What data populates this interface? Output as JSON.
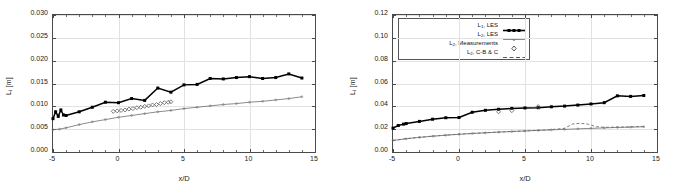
{
  "figure": {
    "panels": [
      "left",
      "right"
    ],
    "background": "#ffffff",
    "axis_color": "#4a4a4a",
    "grid_color": "#e2e2e2",
    "series_color": "#000000",
    "secondary_color": "#808080"
  },
  "left": {
    "ylabel_main": "L",
    "ylabel_sub": "i",
    "ylabel_unit": " [m]",
    "xlabel": "x/D",
    "yticks": [
      "0.000",
      "0.005",
      "0.010",
      "0.015",
      "0.020",
      "0.025",
      "0.030"
    ],
    "xticks": [
      "-5",
      "0",
      "5",
      "10",
      "15"
    ]
  },
  "right": {
    "ylabel_main": "L",
    "ylabel_sub": "i",
    "ylabel_unit": " [m]",
    "xlabel": "x/D",
    "yticks": [
      "0.00",
      "0.02",
      "0.04",
      "0.06",
      "0.08",
      "0.10",
      "0.12"
    ],
    "xticks": [
      "-5",
      "0",
      "5",
      "10",
      "15"
    ],
    "legend": [
      {
        "label_main": "L",
        "label_sub": "1",
        "label_rest": ", LES",
        "key": "solid-marker"
      },
      {
        "label_main": "L",
        "label_sub": "2",
        "label_rest": ", LES",
        "key": "thin-line"
      },
      {
        "label_main": "L",
        "label_sub": "2",
        "label_rest": ", Measurements",
        "key": "diamond"
      },
      {
        "label_main": "L",
        "label_sub": "2",
        "label_rest": ", C-B & C",
        "key": "dashed"
      }
    ]
  },
  "chart_data": [
    {
      "type": "line",
      "panel": "left",
      "title": "",
      "xlabel": "x/D",
      "ylabel": "L_i [m]",
      "xlim": [
        -5,
        15
      ],
      "ylim": [
        0.0,
        0.03
      ],
      "xticks": [
        -5,
        0,
        5,
        10,
        15
      ],
      "yticks": [
        0.0,
        0.005,
        0.01,
        0.015,
        0.02,
        0.025,
        0.03
      ],
      "grid": true,
      "legend_position": "none",
      "series": [
        {
          "name": "L1, LES",
          "style": "solid-with-square-markers",
          "color": "#000000",
          "x": [
            -5.0,
            -4.8,
            -4.6,
            -4.4,
            -4.2,
            -4.0,
            -3.0,
            -2.0,
            -1.0,
            0.0,
            1.0,
            2.0,
            3.0,
            4.0,
            5.0,
            6.0,
            7.0,
            8.0,
            9.0,
            10.0,
            11.0,
            12.0,
            13.0,
            14.0
          ],
          "y": [
            0.0073,
            0.0088,
            0.0078,
            0.0092,
            0.0081,
            0.008,
            0.0088,
            0.0098,
            0.0109,
            0.0108,
            0.0117,
            0.0113,
            0.014,
            0.0131,
            0.0147,
            0.0148,
            0.0161,
            0.016,
            0.0163,
            0.0165,
            0.0161,
            0.0163,
            0.0171,
            0.0162
          ]
        },
        {
          "name": "L2, LES",
          "style": "thin-line-with-small-markers",
          "color": "#6d6d6d",
          "x": [
            -5.0,
            -4.5,
            -4.0,
            -3.0,
            -2.0,
            -1.0,
            0.0,
            1.0,
            2.0,
            3.0,
            4.0,
            5.0,
            6.0,
            7.0,
            8.0,
            9.0,
            10.0,
            11.0,
            12.0,
            13.0,
            14.0
          ],
          "y": [
            0.0049,
            0.005,
            0.0053,
            0.006,
            0.0066,
            0.0071,
            0.0076,
            0.008,
            0.0084,
            0.0088,
            0.0091,
            0.0095,
            0.0098,
            0.0101,
            0.0104,
            0.0106,
            0.0109,
            0.0111,
            0.0114,
            0.0117,
            0.0121
          ]
        },
        {
          "name": "L2, Measurements",
          "style": "diamond-markers",
          "color": "#5a5a5a",
          "x": [
            -0.4,
            -0.1,
            0.2,
            0.5,
            0.8,
            1.1,
            1.4,
            1.7,
            2.0,
            2.3,
            2.6,
            2.9,
            3.2,
            3.5,
            3.8,
            4.0
          ],
          "y": [
            0.0089,
            0.009,
            0.0091,
            0.0092,
            0.0094,
            0.0095,
            0.0097,
            0.0098,
            0.01,
            0.0101,
            0.0103,
            0.0104,
            0.0106,
            0.0108,
            0.0109,
            0.011
          ]
        }
      ]
    },
    {
      "type": "line",
      "panel": "right",
      "title": "",
      "xlabel": "x/D",
      "ylabel": "L_i [m]",
      "xlim": [
        -5,
        15
      ],
      "ylim": [
        0.0,
        0.12
      ],
      "xticks": [
        -5,
        0,
        5,
        10,
        15
      ],
      "yticks": [
        0.0,
        0.02,
        0.04,
        0.06,
        0.08,
        0.1,
        0.12
      ],
      "grid": true,
      "legend_position": "upper-left",
      "series": [
        {
          "name": "L1, LES",
          "style": "solid-with-square-markers",
          "color": "#000000",
          "x": [
            -5.0,
            -4.6,
            -4.2,
            -4.0,
            -3.0,
            -2.0,
            -1.0,
            0.0,
            1.0,
            2.0,
            3.0,
            4.0,
            5.0,
            6.0,
            7.0,
            8.0,
            9.0,
            10.0,
            11.0,
            12.0,
            13.0,
            14.0
          ],
          "y": [
            0.0209,
            0.0232,
            0.0244,
            0.0249,
            0.0268,
            0.0287,
            0.03,
            0.0302,
            0.0348,
            0.0365,
            0.0374,
            0.0382,
            0.0386,
            0.0388,
            0.0396,
            0.0402,
            0.0411,
            0.0421,
            0.0432,
            0.0492,
            0.0487,
            0.0495
          ]
        },
        {
          "name": "L2, LES",
          "style": "thin-line-with-small-markers",
          "color": "#6d6d6d",
          "x": [
            -5.0,
            -4.0,
            -3.0,
            -2.0,
            -1.0,
            0.0,
            1.0,
            2.0,
            3.0,
            4.0,
            5.0,
            6.0,
            7.0,
            8.0,
            9.0,
            10.0,
            11.0,
            12.0,
            13.0,
            14.0
          ],
          "y": [
            0.0101,
            0.0116,
            0.0128,
            0.0138,
            0.0147,
            0.0155,
            0.0162,
            0.0168,
            0.0174,
            0.0179,
            0.0184,
            0.0189,
            0.0194,
            0.0198,
            0.0203,
            0.0207,
            0.0211,
            0.0215,
            0.0218,
            0.0221
          ]
        },
        {
          "name": "L2, Measurements",
          "style": "diamond-markers",
          "color": "#5a5a5a",
          "x": [
            3.0,
            4.0,
            6.0
          ],
          "y": [
            0.0352,
            0.0362,
            0.0398
          ]
        },
        {
          "name": "L2, C-B & C",
          "style": "dashed",
          "color": "#6d6d6d",
          "x": [
            -5.0,
            -4.0,
            -3.0,
            -2.0,
            -1.0,
            0.0,
            1.0,
            2.0,
            3.0,
            4.0,
            5.0,
            6.0,
            7.0,
            8.0,
            8.6,
            9.2,
            9.8,
            10.4,
            11.0,
            12.0,
            13.0,
            14.0
          ],
          "y": [
            0.0101,
            0.0117,
            0.0129,
            0.0139,
            0.0148,
            0.0156,
            0.0163,
            0.0169,
            0.0175,
            0.018,
            0.0185,
            0.019,
            0.0196,
            0.0208,
            0.0245,
            0.0252,
            0.0243,
            0.0222,
            0.0216,
            0.0218,
            0.022,
            0.0224
          ]
        }
      ]
    }
  ]
}
